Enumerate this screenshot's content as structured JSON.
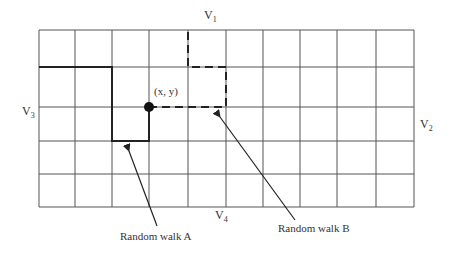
{
  "diagram": {
    "grid": {
      "columns": 10,
      "rows": 5,
      "x_lines": [
        39,
        75,
        112,
        149,
        188,
        226,
        263,
        300,
        337,
        376,
        414
      ],
      "y_lines": [
        30,
        67,
        107,
        141,
        174,
        207
      ],
      "line_color": "#555555"
    },
    "point": {
      "label": "(x, y)",
      "x": 149,
      "y": 107,
      "color": "#111111"
    },
    "boundary_labels": {
      "v1": {
        "main": "V",
        "sub": "1"
      },
      "v2": {
        "main": "V",
        "sub": "2"
      },
      "v3": {
        "main": "V",
        "sub": "3"
      },
      "v4": {
        "main": "V",
        "sub": "4"
      }
    },
    "walks": [
      {
        "name": "Random walk A",
        "style": "solid",
        "path": [
          [
            149,
            107
          ],
          [
            149,
            141
          ],
          [
            112,
            141
          ],
          [
            112,
            67
          ],
          [
            39,
            67
          ]
        ]
      },
      {
        "name": "Random walk B",
        "style": "dashed",
        "path": [
          [
            149,
            107
          ],
          [
            226,
            107
          ],
          [
            226,
            67
          ],
          [
            188,
            67
          ],
          [
            188,
            30
          ]
        ]
      }
    ],
    "annotations": {
      "walk_a_label": "Random walk A",
      "walk_b_label": "Random walk B"
    }
  }
}
